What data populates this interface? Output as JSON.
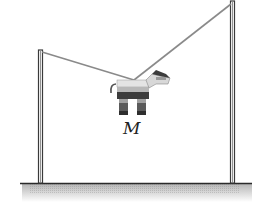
{
  "diagram": {
    "mass_label": "M",
    "colors": {
      "pole": "#3a3a3a",
      "rope": "#8a8a8a",
      "ground_line": "#2a2a2a",
      "ground_shade": "#bdbdbd",
      "pinata_light": "#e8e8e8",
      "pinata_mid": "#9a9a9a",
      "pinata_dark": "#3c3c3c"
    },
    "elements": {
      "left_pole": {
        "x": 40,
        "top": 51,
        "bottom": 183
      },
      "right_pole": {
        "x": 232,
        "top": 2,
        "bottom": 183
      },
      "rope_knot": {
        "x": 134,
        "y": 80
      },
      "ground_y": 183
    }
  }
}
